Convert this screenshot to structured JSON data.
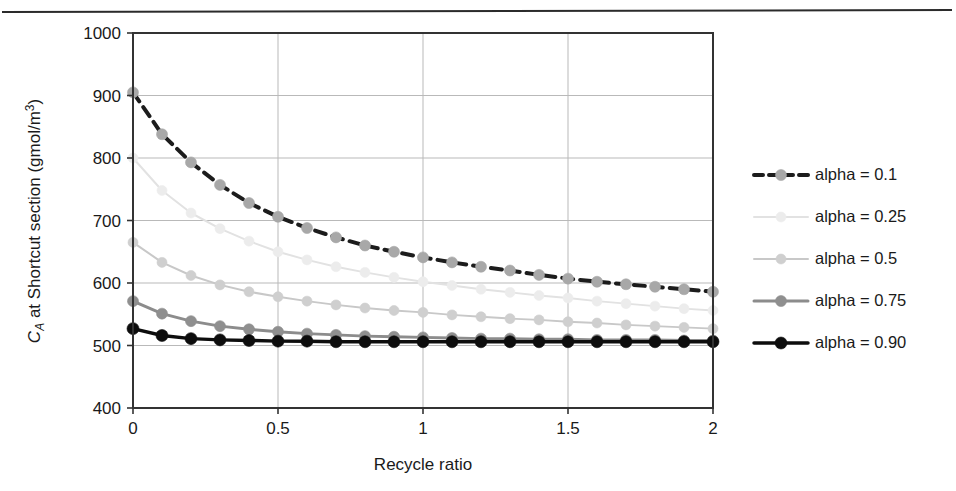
{
  "figure": {
    "has_top_rule": true
  },
  "chart_data": {
    "type": "line",
    "title": "",
    "xlabel": "Recycle ratio",
    "ylabel": "C_A at Shortcut section (gmol/m3)",
    "ylabel_parts": {
      "italic_c": "C",
      "subscript_a": "A",
      "rest": " at Shortcut section (gmol/m",
      "superscript": "3",
      "close": ")"
    },
    "xlim": [
      0,
      2
    ],
    "ylim": [
      400,
      1000
    ],
    "xticks": [
      0,
      0.5,
      1,
      1.5,
      2
    ],
    "xtick_labels": [
      "0",
      "0.5",
      "1",
      "1.5",
      "2"
    ],
    "yticks": [
      400,
      500,
      600,
      700,
      800,
      900,
      1000
    ],
    "ytick_labels": [
      "400",
      "500",
      "600",
      "700",
      "800",
      "900",
      "1000"
    ],
    "grid": "both",
    "legend_position": "right",
    "x": [
      0,
      0.1,
      0.2,
      0.3,
      0.4,
      0.5,
      0.6,
      0.7,
      0.8,
      0.9,
      1,
      1.1,
      1.2,
      1.3,
      1.4,
      1.5,
      1.6,
      1.7,
      1.8,
      1.9,
      2
    ],
    "series": [
      {
        "name": "alpha = 0.1",
        "color": "#1c1c1c",
        "marker_color": "#a8a8a8",
        "line_style": "dashed",
        "line_width": 4,
        "marker_size": 11,
        "values": [
          905,
          838,
          793,
          757,
          728,
          706,
          688,
          673,
          660,
          650,
          641,
          633,
          626,
          620,
          613,
          607,
          602,
          598,
          594,
          590,
          586
        ]
      },
      {
        "name": "alpha = 0.25",
        "color": "#e2e2e2",
        "marker_color": "#ececec",
        "line_style": "solid",
        "line_width": 2,
        "marker_size": 10,
        "values": [
          800,
          748,
          712,
          687,
          667,
          650,
          637,
          626,
          617,
          609,
          602,
          596,
          590,
          585,
          580,
          576,
          571,
          567,
          563,
          559,
          556
        ]
      },
      {
        "name": "alpha = 0.5",
        "color": "#c8c8c8",
        "marker_color": "#cfcfcf",
        "line_style": "solid",
        "line_width": 2,
        "marker_size": 10,
        "values": [
          665,
          633,
          612,
          597,
          586,
          578,
          571,
          565,
          560,
          556,
          553,
          549,
          546,
          543,
          541,
          538,
          536,
          533,
          531,
          529,
          527
        ]
      },
      {
        "name": "alpha = 0.75",
        "color": "#8c8c8c",
        "marker_color": "#8f8f8f",
        "line_style": "solid",
        "line_width": 3,
        "marker_size": 11,
        "values": [
          571,
          551,
          539,
          531,
          526,
          522,
          519,
          517,
          515,
          514,
          513,
          512,
          511,
          511,
          510,
          510,
          509,
          509,
          509,
          508,
          508
        ]
      },
      {
        "name": "alpha = 0.90",
        "color": "#0d0d0d",
        "marker_color": "#0d0d0d",
        "line_style": "solid",
        "line_width": 3.5,
        "marker_size": 12,
        "values": [
          527,
          516,
          511,
          509,
          508,
          507,
          507,
          506,
          506,
          506,
          506,
          506,
          506,
          506,
          506,
          506,
          506,
          506,
          506,
          506,
          506
        ]
      }
    ],
    "legend": [
      {
        "label": "alpha = 0.1"
      },
      {
        "label": "alpha = 0.25"
      },
      {
        "label": "alpha = 0.5"
      },
      {
        "label": "alpha = 0.75"
      },
      {
        "label": "alpha = 0.90"
      }
    ]
  }
}
